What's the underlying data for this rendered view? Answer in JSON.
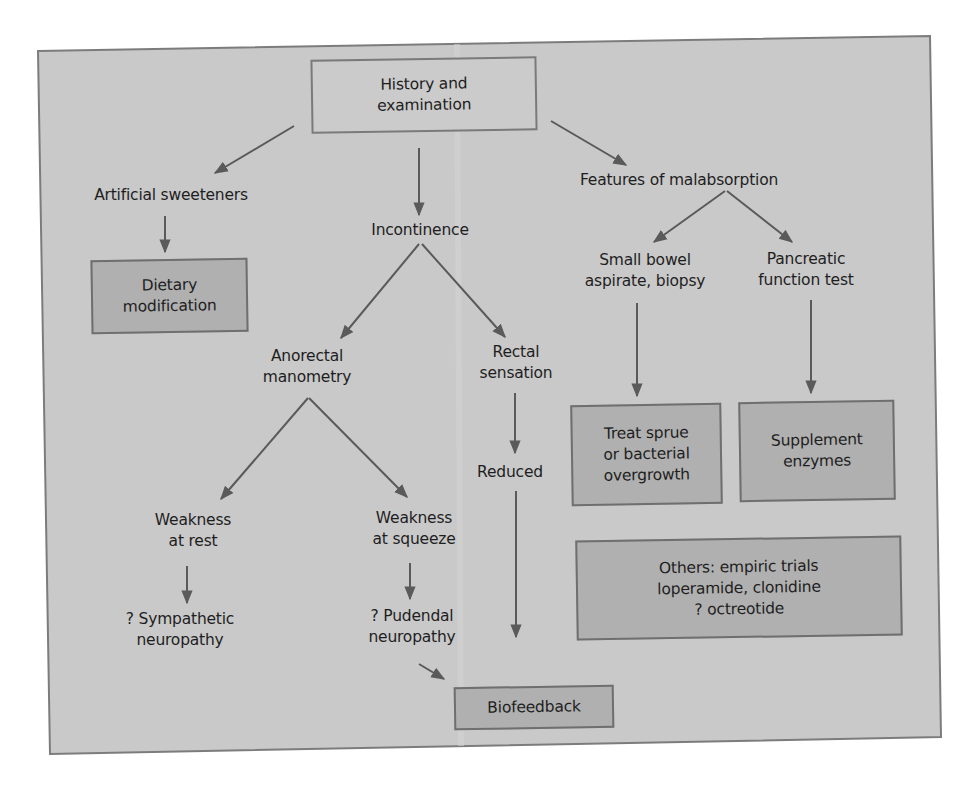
{
  "diagram": {
    "colors": {
      "page_background": "#ffffff",
      "frame_fill": "#c9c9c9",
      "frame_border": "#7c7c7c",
      "action_box_fill": "#b0b0b0",
      "arrow": "#5a5a5a",
      "text": "#1e1e1e"
    },
    "nodes": {
      "history": "History and\nexamination",
      "artificial_sweeteners": "Artificial sweeteners",
      "dietary_modification": "Dietary\nmodification",
      "incontinence": "Incontinence",
      "anorectal_manometry": "Anorectal\nmanometry",
      "rectal_sensation": "Rectal\nsensation",
      "reduced": "Reduced",
      "weakness_rest": "Weakness\nat rest",
      "weakness_squeeze": "Weakness\nat squeeze",
      "sympathetic": "? Sympathetic\nneuropathy",
      "pudendal": "? Pudendal\nneuropathy",
      "biofeedback": "Biofeedback",
      "malabsorption": "Features of malabsorption",
      "small_bowel": "Small bowel\naspirate, biopsy",
      "pancreatic": "Pancreatic\nfunction test",
      "treat_sprue": "Treat sprue\nor bacterial\novergrowth",
      "supplement_enzymes": "Supplement\nenzymes",
      "others": "Others: empiric trials\nloperamide, clonidine\n? octreotide"
    },
    "edges": [
      {
        "from": "history",
        "to": "artificial_sweeteners"
      },
      {
        "from": "history",
        "to": "incontinence"
      },
      {
        "from": "history",
        "to": "malabsorption"
      },
      {
        "from": "artificial_sweeteners",
        "to": "dietary_modification"
      },
      {
        "from": "incontinence",
        "to": "anorectal_manometry"
      },
      {
        "from": "incontinence",
        "to": "rectal_sensation"
      },
      {
        "from": "anorectal_manometry",
        "to": "weakness_rest"
      },
      {
        "from": "anorectal_manometry",
        "to": "weakness_squeeze"
      },
      {
        "from": "weakness_rest",
        "to": "sympathetic"
      },
      {
        "from": "weakness_squeeze",
        "to": "pudendal"
      },
      {
        "from": "pudendal",
        "to": "biofeedback"
      },
      {
        "from": "rectal_sensation",
        "to": "reduced"
      },
      {
        "from": "reduced",
        "to": "biofeedback"
      },
      {
        "from": "malabsorption",
        "to": "small_bowel"
      },
      {
        "from": "malabsorption",
        "to": "pancreatic"
      },
      {
        "from": "small_bowel",
        "to": "treat_sprue"
      },
      {
        "from": "pancreatic",
        "to": "supplement_enzymes"
      }
    ]
  }
}
